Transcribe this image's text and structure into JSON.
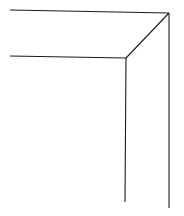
{
  "diagram": {
    "type": "line-drawing",
    "stroke_color": "#1a1a1a",
    "background": "#ffffff",
    "lines": [
      {
        "name": "outer-top-edge",
        "x1": 10,
        "y1": 10,
        "x2": 169,
        "y2": 13
      },
      {
        "name": "outer-right-edge",
        "x1": 169,
        "y1": 13,
        "x2": 169,
        "y2": 208
      },
      {
        "name": "inner-top-edge",
        "x1": 10,
        "y1": 56,
        "x2": 126,
        "y2": 58
      },
      {
        "name": "inner-right-edge",
        "x1": 126,
        "y1": 58,
        "x2": 125,
        "y2": 202
      },
      {
        "name": "mitre-diagonal",
        "x1": 126,
        "y1": 58,
        "x2": 169,
        "y2": 13
      }
    ]
  }
}
